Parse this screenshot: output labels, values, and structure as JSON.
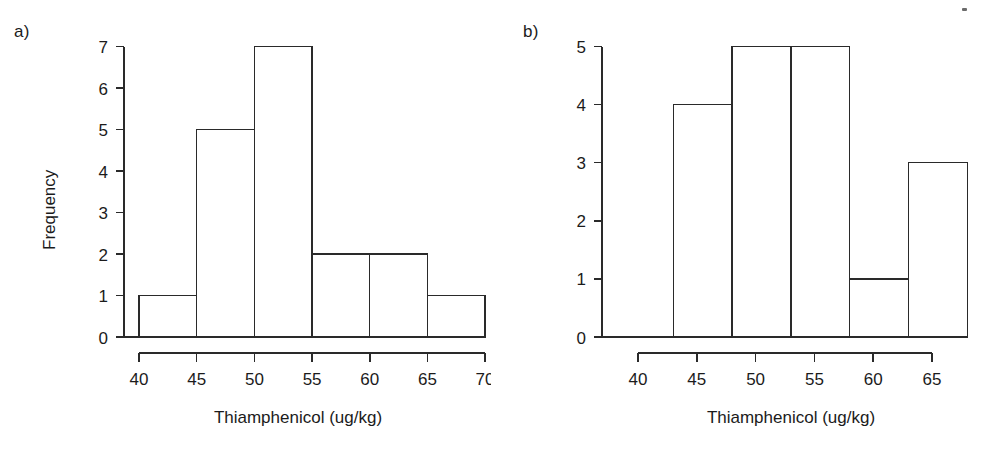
{
  "figure": {
    "background": "#ffffff",
    "ink_color": "#2a2a2a",
    "artifact_label": "scan-speck"
  },
  "panels": [
    {
      "id": "a",
      "label": "a)",
      "xlabel": "Thiamphenicol (ug/kg)",
      "ylabel": "Frequency",
      "x_ticks": [
        "40",
        "45",
        "50",
        "55",
        "60",
        "65",
        "70"
      ],
      "y_ticks": [
        "0",
        "1",
        "2",
        "3",
        "4",
        "5",
        "6",
        "7"
      ]
    },
    {
      "id": "b",
      "label": "b)",
      "xlabel": "Thiamphenicol (ug/kg)",
      "ylabel": "",
      "x_ticks": [
        "40",
        "45",
        "50",
        "55",
        "60",
        "65"
      ],
      "y_ticks": [
        "0",
        "1",
        "2",
        "3",
        "4",
        "5"
      ]
    }
  ],
  "chart_data": [
    {
      "type": "bar",
      "panel": "a",
      "title": "a)",
      "xlabel": "Thiamphenicol (ug/kg)",
      "ylabel": "Frequency",
      "bin_edges": [
        40,
        45,
        50,
        55,
        60,
        65,
        70
      ],
      "categories": [
        "40-45",
        "45-50",
        "50-55",
        "55-60",
        "60-65",
        "65-70"
      ],
      "values": [
        1,
        5,
        7,
        2,
        2,
        1
      ],
      "xlim": [
        40,
        70
      ],
      "ylim": [
        0,
        7
      ],
      "x_tick_values": [
        40,
        45,
        50,
        55,
        60,
        65,
        70
      ],
      "y_tick_values": [
        0,
        1,
        2,
        3,
        4,
        5,
        6,
        7
      ],
      "grid": false,
      "legend": false
    },
    {
      "type": "bar",
      "panel": "b",
      "title": "b)",
      "xlabel": "Thiamphenicol (ug/kg)",
      "ylabel": "",
      "bin_edges": [
        43,
        48,
        53,
        58,
        63,
        68
      ],
      "categories": [
        "43-48",
        "48-53",
        "53-58",
        "58-63",
        "63-68"
      ],
      "values": [
        4,
        5,
        5,
        1,
        3
      ],
      "xlim": [
        38,
        68
      ],
      "ylim": [
        0,
        5
      ],
      "x_tick_values": [
        40,
        45,
        50,
        55,
        60,
        65
      ],
      "y_tick_values": [
        0,
        1,
        2,
        3,
        4,
        5
      ],
      "grid": false,
      "legend": false
    }
  ]
}
